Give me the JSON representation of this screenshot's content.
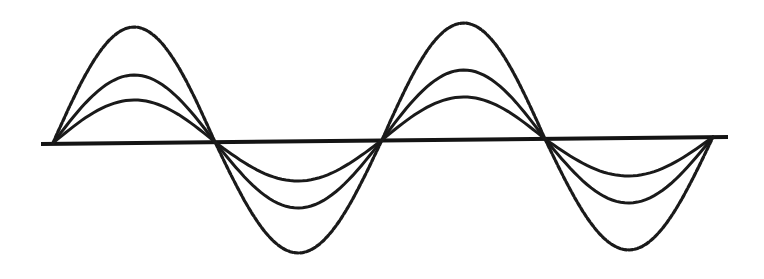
{
  "diagram": {
    "colors": {
      "background": "#ffffff",
      "stroke": "#1a1a1a"
    },
    "axis": {
      "x1": 41,
      "y1": 144,
      "x2": 728,
      "y2": 137
    },
    "nodes_x": [
      53,
      215,
      382,
      545,
      713
    ],
    "node_y": [
      143,
      142,
      140,
      139,
      137
    ],
    "lobes": [
      {
        "direction": "up",
        "peak_x": 132,
        "peaks": {
          "dashed": 27,
          "middle": 75,
          "inner": 100
        }
      },
      {
        "direction": "down",
        "peak_x": 298,
        "peaks": {
          "dashed": 253,
          "middle": 208,
          "inner": 181
        }
      },
      {
        "direction": "up",
        "peak_x": 463,
        "peaks": {
          "dashed": 23,
          "middle": 70,
          "inner": 97
        }
      },
      {
        "direction": "down",
        "peak_x": 630,
        "peaks": {
          "dashed": 250,
          "middle": 203,
          "inner": 176
        }
      }
    ],
    "curves": [
      {
        "name": "outer-envelope",
        "style": "dashed"
      },
      {
        "name": "middle-wave",
        "style": "solid"
      },
      {
        "name": "inner-wave",
        "style": "solid"
      }
    ]
  }
}
